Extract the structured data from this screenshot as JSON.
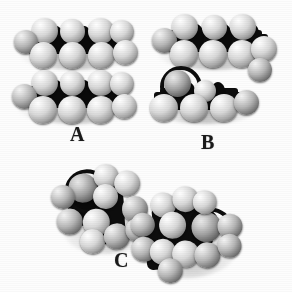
{
  "figure": {
    "background_color": "#fdfdfd",
    "atom_color": "#e6e6e6",
    "bond_color": "#0d0d0d",
    "label_color": "#1a1a1a"
  },
  "panels": [
    {
      "id": "A",
      "label": "A",
      "description": "Two identical straight-chain alkane space-filling models stacked horizontally",
      "models": [
        {
          "name": "upper-chain",
          "orientation": "horizontal",
          "carbons": 4
        },
        {
          "name": "lower-chain",
          "orientation": "horizontal",
          "carbons": 4
        }
      ]
    },
    {
      "id": "B",
      "label": "B",
      "description": "Upper straight-chain model and a lower shorter branched model",
      "models": [
        {
          "name": "upper-chain",
          "orientation": "horizontal",
          "carbons": 4
        },
        {
          "name": "lower-chain",
          "orientation": "horizontal",
          "carbons": 3
        }
      ]
    },
    {
      "id": "C",
      "label": "C",
      "description": "Two branched alkane space-filling models viewed end-on, tilted diagonally",
      "models": [
        {
          "name": "left-branched",
          "orientation": "diagonal",
          "carbons": 4
        },
        {
          "name": "right-branched",
          "orientation": "diagonal",
          "carbons": 4
        }
      ]
    }
  ]
}
